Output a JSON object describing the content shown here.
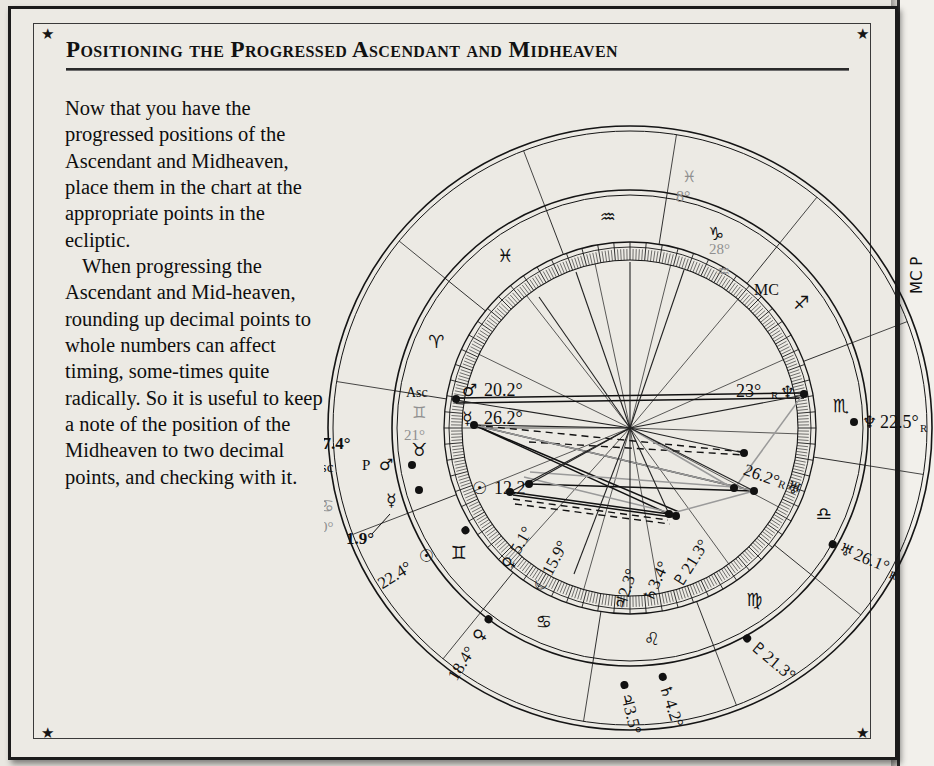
{
  "page": {
    "heading": "Positioning the Progressed Ascendant and Midheaven",
    "corner_star": "★"
  },
  "copy": {
    "para1": "Now that you have the progressed positions of the Ascendant and Midheaven, place them in the chart at the appropriate points in the ecliptic.",
    "para2": "When progressing the Ascendant and Mid-heaven, rounding up decimal points to whole numbers can affect timing, some-times quite radically. So it is useful to keep a note of the position of the Midheaven to two decimal points, and checking with it."
  },
  "chart_data": {
    "type": "astrological-natal-wheel",
    "angles": {
      "asc_label": "Asc",
      "asc_sign_glyph": "♊",
      "asc_degree": "21°",
      "mc_label": "MC",
      "mc_degree": "28°",
      "mc_sign_glyph": "♒",
      "progressed_mc_label": "MC P",
      "progressed_mc_sign_glyph": "♓",
      "progressed_mc_degree": "8°",
      "progressed_asc_degree": "27.4°",
      "progressed_asc_label": "Asc",
      "progressed_asc_p": "P",
      "progressed_asc_glyph": "♂",
      "asc_alt_sign_glyph": "♋",
      "asc_alt_degree": "0°"
    },
    "zodiac_ring": [
      {
        "glyph": "♈",
        "name": "Aries"
      },
      {
        "glyph": "♓",
        "name": "Pisces"
      },
      {
        "glyph": "♒",
        "name": "Aquarius"
      },
      {
        "glyph": "♑",
        "name": "Capricorn"
      },
      {
        "glyph": "♐",
        "name": "Sagittarius"
      },
      {
        "glyph": "♏",
        "name": "Scorpio"
      },
      {
        "glyph": "♎",
        "name": "Libra"
      },
      {
        "glyph": "♍",
        "name": "Virgo"
      },
      {
        "glyph": "♌",
        "name": "Leo"
      },
      {
        "glyph": "♋",
        "name": "Cancer"
      },
      {
        "glyph": "♊",
        "name": "Gemini"
      },
      {
        "glyph": "♉",
        "name": "Taurus"
      }
    ],
    "inner_planets": [
      {
        "glyph": "♂",
        "name": "Mars",
        "value": "20.2°"
      },
      {
        "glyph": "☿",
        "name": "Mercury",
        "value": "26.2°"
      },
      {
        "glyph": "☉",
        "name": "Sun",
        "value": "12.2°"
      },
      {
        "glyph": "♀",
        "name": "Venus",
        "value": "5.1°"
      },
      {
        "glyph": "☾",
        "name": "Moon",
        "value": "15.9°"
      },
      {
        "glyph": "♃",
        "name": "Jupiter",
        "value": "2.3°"
      },
      {
        "glyph": "♄",
        "name": "Saturn",
        "value": "3.4°"
      },
      {
        "glyph": "♇",
        "name": "Pluto",
        "value": "21.3°"
      },
      {
        "glyph": "♅",
        "name": "Uranus",
        "value": "26.2°",
        "retrograde": "R"
      },
      {
        "glyph": "♆",
        "name": "Neptune",
        "value": "23°",
        "retrograde": "R"
      }
    ],
    "outer_planets": [
      {
        "glyph": "♆",
        "name": "Neptune",
        "value": "22.5°",
        "retrograde": "R"
      },
      {
        "glyph": "♅",
        "name": "Uranus",
        "value": "26.1°",
        "retrograde": "R"
      },
      {
        "glyph": "♇",
        "name": "Pluto",
        "value": "21.3°"
      },
      {
        "glyph": "♄",
        "name": "Saturn",
        "value": "4.2°"
      },
      {
        "glyph": "♃",
        "name": "Jupiter",
        "value": "3.5°"
      },
      {
        "glyph": "♀",
        "name": "Venus",
        "value": "18.4°"
      },
      {
        "glyph": "☉",
        "name": "Sun",
        "value": "22.4°"
      },
      {
        "glyph": "☿",
        "name": "Mercury",
        "value": "1.9°"
      }
    ],
    "colors": {
      "ink": "#101010",
      "gray": "#8f8f8f",
      "paper": "#eceae4"
    }
  }
}
